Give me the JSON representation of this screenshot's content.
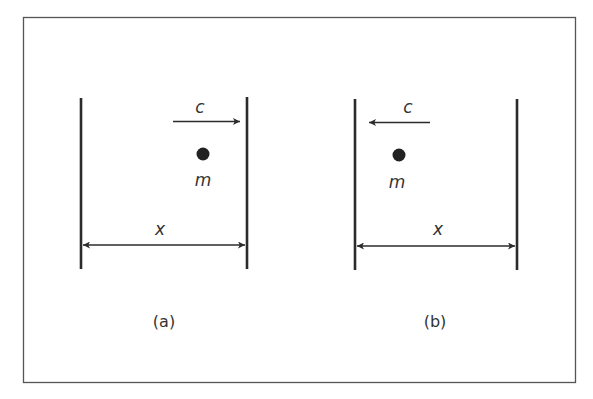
{
  "figure": {
    "colors": {
      "ink": "#2b2b2b",
      "frame": "#555555",
      "background": "#ffffff"
    },
    "panels": [
      {
        "id": "a",
        "caption": "(a)",
        "velocity_label": "c",
        "velocity_direction": "right",
        "mass_label": "m",
        "distance_label": "x"
      },
      {
        "id": "b",
        "caption": "(b)",
        "velocity_label": "c",
        "velocity_direction": "left",
        "mass_label": "m",
        "distance_label": "x"
      }
    ]
  }
}
